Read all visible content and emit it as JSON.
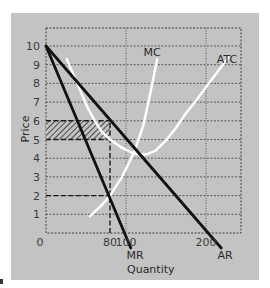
{
  "chart_data": {
    "type": "line",
    "title": "",
    "xlabel": "Quantity",
    "ylabel": "Price",
    "xlim": [
      0,
      244
    ],
    "ylim": [
      0,
      10.96
    ],
    "grid": true,
    "x_ticks": [
      {
        "value": 0,
        "label": "0"
      },
      {
        "value": 80,
        "label": "80"
      },
      {
        "value": 100,
        "label": "100"
      },
      {
        "value": 200,
        "label": "200"
      }
    ],
    "y_ticks": [
      {
        "value": 1,
        "label": "1"
      },
      {
        "value": 2,
        "label": "2"
      },
      {
        "value": 3,
        "label": "3"
      },
      {
        "value": 4,
        "label": "4"
      },
      {
        "value": 5,
        "label": "5"
      },
      {
        "value": 6,
        "label": "6"
      },
      {
        "value": 7,
        "label": "7"
      },
      {
        "value": 8,
        "label": "8"
      },
      {
        "value": 9,
        "label": "9"
      },
      {
        "value": 10,
        "label": "10"
      }
    ],
    "series": [
      {
        "name": "AR",
        "color": "#111111",
        "points": [
          [
            0,
            10
          ],
          [
            219,
            -0.8
          ]
        ]
      },
      {
        "name": "MR",
        "color": "#111111",
        "points": [
          [
            0,
            10
          ],
          [
            106,
            -0.8
          ]
        ]
      },
      {
        "name": "MC",
        "color": "#ffffff",
        "points": [
          [
            55,
            0.9
          ],
          [
            70,
            1.5
          ],
          [
            80,
            2.0
          ],
          [
            95,
            3.0
          ],
          [
            110,
            4.3
          ],
          [
            122,
            5.8
          ],
          [
            132,
            7.8
          ],
          [
            139,
            9.3
          ]
        ]
      },
      {
        "name": "ATC",
        "color": "#ffffff",
        "points": [
          [
            26,
            9.3
          ],
          [
            35,
            8.4
          ],
          [
            43,
            7.6
          ],
          [
            52,
            6.7
          ],
          [
            61,
            6.0
          ],
          [
            70,
            5.4
          ],
          [
            80,
            5.0
          ],
          [
            95,
            4.55
          ],
          [
            110,
            4.25
          ],
          [
            125,
            4.2
          ],
          [
            137,
            4.4
          ],
          [
            150,
            4.95
          ],
          [
            162,
            5.6
          ],
          [
            175,
            6.4
          ],
          [
            188,
            7.1
          ],
          [
            200,
            7.8
          ],
          [
            214,
            8.6
          ],
          [
            228,
            9.4
          ]
        ]
      }
    ],
    "annotations": [
      {
        "type": "hatched-rect",
        "q": [
          0,
          80
        ],
        "p": [
          5,
          6
        ],
        "meaning": "profit area"
      },
      {
        "type": "dashed-line",
        "from": [
          0,
          6
        ],
        "to": [
          80,
          6
        ]
      },
      {
        "type": "dashed-line",
        "from": [
          0,
          5
        ],
        "to": [
          80,
          5
        ]
      },
      {
        "type": "dashed-line",
        "from": [
          0,
          2
        ],
        "to": [
          80,
          2
        ]
      },
      {
        "type": "dashed-line",
        "from": [
          80,
          0
        ],
        "to": [
          80,
          6
        ]
      }
    ],
    "curve_labels": [
      {
        "text": "MC",
        "q": 135,
        "p": 10.3
      },
      {
        "text": "ATC",
        "q": 226,
        "p": 9.75
      },
      {
        "text": "MR",
        "q": 106,
        "p": -1.2
      },
      {
        "text": "AR",
        "q": 224,
        "p": -1.2
      }
    ],
    "legend": null
  },
  "labels": {
    "y_axis": "Price",
    "x_axis": "Quantity",
    "mc": "MC",
    "atc": "ATC",
    "mr": "MR",
    "ar": "AR",
    "origin": "0",
    "x80": "80",
    "x100": "100",
    "x200": "200"
  },
  "colors": {
    "panel": "#c3c3c3",
    "grid": "#3f3f3f",
    "dark_line": "#111111",
    "white_line": "#ffffff"
  }
}
